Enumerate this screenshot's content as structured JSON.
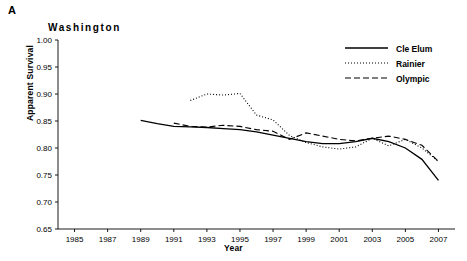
{
  "panel": {
    "label": "A",
    "title": "Washington"
  },
  "chart_data": {
    "type": "line",
    "title": "Washington",
    "xlabel": "Year",
    "ylabel": "Apparent Survival",
    "xlim": [
      1984,
      2008
    ],
    "ylim": [
      0.65,
      1.0
    ],
    "ytick_labels": [
      "0.65",
      "0.70",
      "0.75",
      "0.80",
      "0.85",
      "0.90",
      "0.95",
      "1.00"
    ],
    "ytick_values": [
      0.65,
      0.7,
      0.75,
      0.8,
      0.85,
      0.9,
      0.95,
      1.0
    ],
    "xtick_labels": [
      "1985",
      "1987",
      "1989",
      "1991",
      "1993",
      "1995",
      "1997",
      "1999",
      "2001",
      "2003",
      "2005",
      "2007"
    ],
    "xtick_values": [
      1985,
      1987,
      1989,
      1991,
      1993,
      1995,
      1997,
      1999,
      2001,
      2003,
      2005,
      2007
    ],
    "grid": false,
    "legend_position": "top-right",
    "series": [
      {
        "name": "Cle Elum",
        "style": "solid",
        "color": "#000000",
        "x": [
          1989,
          1990,
          1991,
          1992,
          1993,
          1994,
          1995,
          1996,
          1997,
          1998,
          1999,
          2000,
          2001,
          2002,
          2003,
          2004,
          2005,
          2006,
          2007
        ],
        "y": [
          0.851,
          0.845,
          0.84,
          0.839,
          0.838,
          0.836,
          0.834,
          0.83,
          0.824,
          0.818,
          0.812,
          0.808,
          0.808,
          0.812,
          0.818,
          0.812,
          0.8,
          0.779,
          0.74
        ]
      },
      {
        "name": "Rainier",
        "style": "dotted",
        "color": "#000000",
        "x": [
          1992,
          1993,
          1994,
          1995,
          1996,
          1997,
          1998,
          1999,
          2000,
          2001,
          2002,
          2003,
          2004,
          2005,
          2006,
          2007
        ],
        "y": [
          0.888,
          0.9,
          0.898,
          0.901,
          0.861,
          0.852,
          0.823,
          0.81,
          0.802,
          0.798,
          0.802,
          0.818,
          0.804,
          0.816,
          0.8,
          0.775
        ]
      },
      {
        "name": "Olympic",
        "style": "dashed",
        "color": "#000000",
        "x": [
          1991,
          1992,
          1993,
          1994,
          1995,
          1996,
          1997,
          1998,
          1999,
          2000,
          2001,
          2002,
          2003,
          2004,
          2005,
          2006,
          2007
        ],
        "y": [
          0.846,
          0.84,
          0.839,
          0.842,
          0.84,
          0.834,
          0.831,
          0.816,
          0.828,
          0.822,
          0.816,
          0.813,
          0.818,
          0.822,
          0.816,
          0.805,
          0.775
        ]
      }
    ]
  },
  "legend": {
    "items": [
      {
        "label": "Cle Elum",
        "style": "solid"
      },
      {
        "label": "Rainier",
        "style": "dotted"
      },
      {
        "label": "Olympic",
        "style": "dashed"
      }
    ]
  }
}
